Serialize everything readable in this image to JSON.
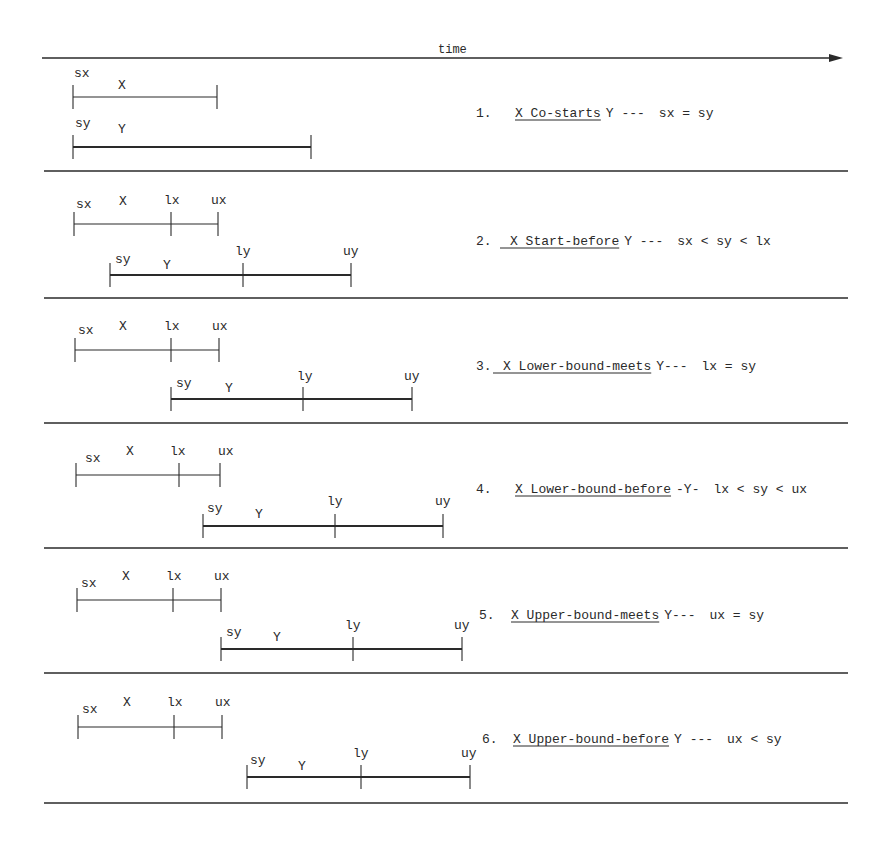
{
  "diagram": {
    "axis": {
      "label": "time",
      "direction": "right",
      "y": 58,
      "x_start": 42,
      "x_end": 843
    },
    "colors": {
      "line": "#2a2a2a",
      "background": "#ffffff"
    },
    "separators_y": [
      171,
      298,
      423,
      548,
      673,
      803
    ],
    "panels": [
      {
        "index": "1.",
        "relation_name": "X Co-starts",
        "relation_prefix": "",
        "trailing": "Y   ---",
        "condition": "sx = sy",
        "text_x": 476,
        "text_y": 117,
        "name_x": 515,
        "x_interval": {
          "name": "X",
          "y": 97,
          "points": [
            {
              "label": "sx",
              "x": 73
            },
            {
              "label": "",
              "x": 217
            }
          ],
          "name_x": 118,
          "name_y": 89,
          "labels": [
            {
              "text": "sx",
              "x": 74,
              "y": 77
            }
          ]
        },
        "y_interval": {
          "name": "Y",
          "y": 147,
          "points": [
            {
              "label": "sy",
              "x": 73
            },
            {
              "label": "",
              "x": 311
            }
          ],
          "name_x": 118,
          "name_y": 133,
          "labels": [
            {
              "text": "sy",
              "x": 75,
              "y": 127
            }
          ]
        }
      },
      {
        "index": "2.",
        "relation_name": "X Start-before",
        "relation_prefix": "__",
        "trailing": "Y ---",
        "condition": "sx < sy < lx",
        "text_x": 476,
        "text_y": 245,
        "name_x": 510,
        "x_interval": {
          "name": "X",
          "y": 224,
          "points": [
            {
              "x": 74
            },
            {
              "x": 171
            },
            {
              "x": 218
            }
          ],
          "name_x": 119,
          "name_y": 205,
          "labels": [
            {
              "text": "sx",
              "x": 76,
              "y": 208
            },
            {
              "text": "lx",
              "x": 164,
              "y": 204
            },
            {
              "text": "ux",
              "x": 211,
              "y": 204
            }
          ]
        },
        "y_interval": {
          "name": "Y",
          "y": 275,
          "points": [
            {
              "x": 110
            },
            {
              "x": 243
            },
            {
              "x": 351
            }
          ],
          "name_x": 163,
          "name_y": 269,
          "labels": [
            {
              "text": "sy",
              "x": 115,
              "y": 263
            },
            {
              "text": "ly",
              "x": 235,
              "y": 255
            },
            {
              "text": "uy",
              "x": 343,
              "y": 255
            }
          ]
        }
      },
      {
        "index": "3.",
        "relation_name": "X Lower-bound-meets",
        "relation_prefix": "__",
        "trailing": "Y---",
        "condition": "lx = sy",
        "text_x": 476,
        "text_y": 370,
        "name_x": 503,
        "x_interval": {
          "name": "X",
          "y": 350,
          "points": [
            {
              "x": 75
            },
            {
              "x": 171
            },
            {
              "x": 219
            }
          ],
          "name_x": 119,
          "name_y": 330,
          "labels": [
            {
              "text": "sx",
              "x": 78,
              "y": 334
            },
            {
              "text": "lx",
              "x": 164,
              "y": 330
            },
            {
              "text": "ux",
              "x": 212,
              "y": 330
            }
          ]
        },
        "y_interval": {
          "name": "Y",
          "y": 399,
          "points": [
            {
              "x": 171
            },
            {
              "x": 303
            },
            {
              "x": 412
            }
          ],
          "name_x": 225,
          "name_y": 392,
          "labels": [
            {
              "text": "sy",
              "x": 176,
              "y": 387
            },
            {
              "text": "ly",
              "x": 297,
              "y": 380
            },
            {
              "text": "uy",
              "x": 404,
              "y": 380
            }
          ]
        }
      },
      {
        "index": "4.",
        "relation_name": "X Lower-bound-before",
        "relation_prefix": "",
        "trailing": "-Y-",
        "condition": "lx < sy < ux",
        "text_x": 476,
        "text_y": 493,
        "name_x": 515,
        "x_interval": {
          "name": "X",
          "y": 475,
          "points": [
            {
              "x": 76
            },
            {
              "x": 179
            },
            {
              "x": 220
            }
          ],
          "name_x": 126,
          "name_y": 455,
          "labels": [
            {
              "text": "sx",
              "x": 85,
              "y": 462
            },
            {
              "text": "lx",
              "x": 170,
              "y": 455
            },
            {
              "text": "ux",
              "x": 218,
              "y": 455
            }
          ]
        },
        "y_interval": {
          "name": "Y",
          "y": 526,
          "points": [
            {
              "x": 203
            },
            {
              "x": 335
            },
            {
              "x": 443
            }
          ],
          "name_x": 255,
          "name_y": 518,
          "labels": [
            {
              "text": "sy",
              "x": 207,
              "y": 512
            },
            {
              "text": "ly",
              "x": 327,
              "y": 505
            },
            {
              "text": "uy",
              "x": 435,
              "y": 505
            }
          ]
        }
      },
      {
        "index": "5.",
        "relation_name": "X Upper-bound-meets",
        "relation_prefix": "",
        "trailing": "Y---",
        "condition": "ux = sy",
        "text_x": 479,
        "text_y": 619,
        "name_x": 511,
        "x_interval": {
          "name": "X",
          "y": 600,
          "points": [
            {
              "x": 77
            },
            {
              "x": 173
            },
            {
              "x": 221
            }
          ],
          "name_x": 122,
          "name_y": 580,
          "labels": [
            {
              "text": "sx",
              "x": 81,
              "y": 587
            },
            {
              "text": "lx",
              "x": 166,
              "y": 580
            },
            {
              "text": "ux",
              "x": 214,
              "y": 580
            }
          ]
        },
        "y_interval": {
          "name": "Y",
          "y": 649,
          "points": [
            {
              "x": 221
            },
            {
              "x": 353
            },
            {
              "x": 462
            }
          ],
          "name_x": 273,
          "name_y": 641,
          "labels": [
            {
              "text": "sy",
              "x": 226,
              "y": 636
            },
            {
              "text": "ly",
              "x": 345,
              "y": 629
            },
            {
              "text": "uy",
              "x": 454,
              "y": 629
            }
          ]
        }
      },
      {
        "index": "6.",
        "relation_name": "X Upper-bound-before",
        "relation_prefix": "",
        "trailing": "Y  ---",
        "condition": "ux < sy",
        "text_x": 482,
        "text_y": 743,
        "name_x": 513,
        "x_interval": {
          "name": "X",
          "y": 727,
          "points": [
            {
              "x": 78
            },
            {
              "x": 174
            },
            {
              "x": 222
            }
          ],
          "name_x": 123,
          "name_y": 706,
          "labels": [
            {
              "text": "sx",
              "x": 82,
              "y": 713
            },
            {
              "text": "lx",
              "x": 167,
              "y": 706
            },
            {
              "text": "ux",
              "x": 215,
              "y": 706
            }
          ]
        },
        "y_interval": {
          "name": "Y",
          "y": 777,
          "points": [
            {
              "x": 247
            },
            {
              "x": 361
            },
            {
              "x": 470
            }
          ],
          "name_x": 298,
          "name_y": 770,
          "labels": [
            {
              "text": "sy",
              "x": 250,
              "y": 764
            },
            {
              "text": "ly",
              "x": 353,
              "y": 757
            },
            {
              "text": "uy",
              "x": 461,
              "y": 757
            }
          ]
        }
      }
    ]
  }
}
